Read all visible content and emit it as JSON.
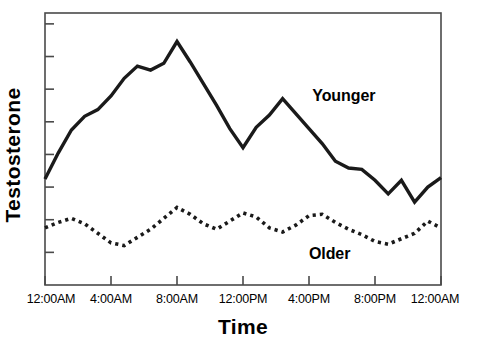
{
  "chart_data": {
    "type": "line",
    "title": "",
    "subtitle": "",
    "xlabel": "Time",
    "ylabel": "Testosterone",
    "grid": false,
    "legend_position": "inline-annotation",
    "xlim": [
      0,
      24
    ],
    "ylim": [
      0,
      100
    ],
    "x_tick_labels": [
      "12:00AM",
      "4:00AM",
      "8:00AM",
      "12:00PM",
      "4:00PM",
      "8:00PM",
      "12:00AM"
    ],
    "x_tick_values": [
      0,
      4,
      8,
      12,
      16,
      20,
      24
    ],
    "y_tick_labels": [],
    "y_tick_values": [
      12,
      24,
      36,
      48,
      60,
      72,
      84,
      96
    ],
    "x_axis_unit": "hour of day",
    "series": [
      {
        "name": "Younger",
        "style": "solid",
        "color": "#1a1a1a",
        "x": [
          0,
          0.8,
          1.6,
          2.4,
          3.2,
          4.0,
          4.8,
          5.6,
          6.4,
          7.2,
          8.0,
          8.8,
          9.6,
          10.4,
          11.2,
          12.0,
          12.8,
          13.6,
          14.4,
          15.2,
          16.0,
          16.8,
          17.6,
          18.4,
          19.2,
          20.0,
          20.8,
          21.6,
          22.4,
          23.2,
          24.0
        ],
        "y": [
          39.0,
          48.5,
          57.0,
          62.0,
          64.5,
          69.5,
          76.0,
          80.5,
          79.0,
          81.5,
          89.5,
          82.0,
          74.0,
          66.0,
          57.5,
          50.5,
          58.0,
          62.5,
          68.5,
          63.0,
          57.5,
          52.0,
          45.5,
          43.0,
          42.5,
          38.5,
          33.5,
          38.5,
          30.5,
          36.0,
          39.5
        ]
      },
      {
        "name": "Older",
        "style": "dotted",
        "color": "#1a1a1a",
        "x": [
          0,
          0.8,
          1.6,
          2.4,
          3.2,
          4.0,
          4.8,
          5.6,
          6.4,
          7.2,
          8.0,
          8.8,
          9.6,
          10.4,
          11.2,
          12.0,
          12.8,
          13.6,
          14.4,
          15.2,
          16.0,
          16.8,
          17.6,
          18.4,
          19.2,
          20.0,
          20.8,
          21.6,
          22.4,
          23.2,
          24.0
        ],
        "y": [
          21.0,
          23.0,
          24.5,
          22.5,
          19.0,
          15.5,
          14.5,
          17.5,
          20.5,
          24.5,
          28.5,
          26.0,
          22.5,
          20.5,
          23.5,
          26.5,
          25.0,
          21.0,
          19.5,
          22.0,
          25.5,
          26.0,
          23.0,
          20.5,
          18.5,
          16.0,
          15.0,
          17.0,
          19.0,
          23.5,
          21.0
        ]
      }
    ],
    "annotations": [
      {
        "text": "Younger",
        "x": 16.2,
        "y": 67.5
      },
      {
        "text": "Older",
        "x": 16.0,
        "y": 9.5
      }
    ]
  },
  "plot": {
    "left_px": 45,
    "right_px": 441,
    "top_px": 13,
    "bottom_px": 285,
    "frame_color": "#4a4a4a"
  }
}
